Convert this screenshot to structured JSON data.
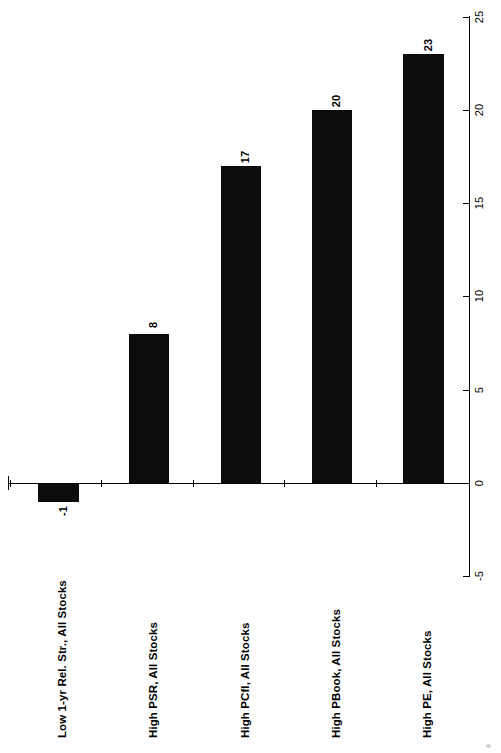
{
  "chart_data": {
    "type": "bar",
    "title": "",
    "subtitle": "",
    "xlabel": "",
    "ylabel": "",
    "orientation": "rotated-90-ccw",
    "grid": false,
    "legend": null,
    "categories": [
      "Low 1-yr Rel. Str., All Stocks",
      "High PSR, All Stocks",
      "High PCfl, All Stocks",
      "High PBook, All Stocks",
      "High PE, All Stocks"
    ],
    "values": [
      -1,
      8,
      17,
      20,
      23
    ],
    "data_labels": [
      "-1",
      "8",
      "17",
      "20",
      "23"
    ],
    "ylim": [
      -5,
      25
    ],
    "yticks": [
      -5,
      0,
      5,
      10,
      15,
      20,
      25
    ],
    "ytick_labels": [
      "-5",
      "0",
      "5",
      "10",
      "15",
      "20",
      "25"
    ],
    "bar_color": "#0c0c0c",
    "axis_color": "#000000",
    "background_color": "#ffffff"
  },
  "geometry": {
    "zero_px": 483,
    "px_per_unit": 18.66,
    "value_axis_x": 469,
    "bars": [
      {
        "left": 38,
        "width": 41
      },
      {
        "left": 129,
        "width": 40
      },
      {
        "left": 221,
        "width": 40
      },
      {
        "left": 312,
        "width": 40
      },
      {
        "left": 403,
        "width": 41
      }
    ],
    "cat_ticks": [
      10,
      101,
      193,
      284,
      376
    ],
    "cat_label_x": [
      56,
      147,
      239,
      330,
      421
    ],
    "cat_label_baseline": 738
  }
}
